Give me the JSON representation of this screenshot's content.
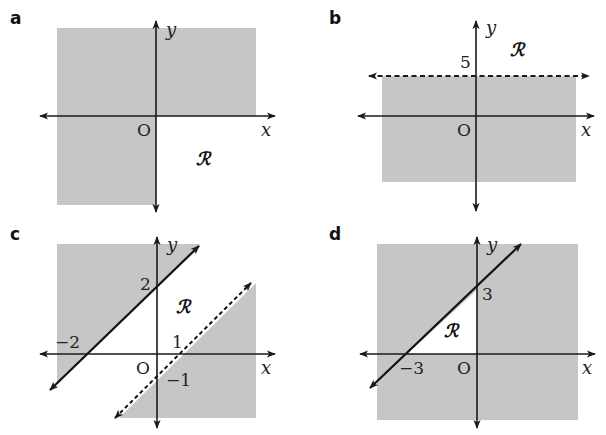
{
  "colors": {
    "shade": "#c6c6c6",
    "axis": "#1a1a1a",
    "background": "#ffffff"
  },
  "panels": [
    {
      "label": "a",
      "x_axis_label": "x",
      "y_axis_label": "y",
      "origin_label": "O",
      "region_label": "ℛ",
      "description": "Shaded everywhere except quadrant x>0, y<0 (region R unshaded)"
    },
    {
      "label": "b",
      "x_axis_label": "x",
      "y_axis_label": "y",
      "origin_label": "O",
      "region_label": "ℛ",
      "tick_labels": [
        "5"
      ],
      "boundary": {
        "equation": "y = 5",
        "style": "dashed"
      }
    },
    {
      "label": "c",
      "x_axis_label": "x",
      "y_axis_label": "y",
      "origin_label": "O",
      "region_label": "ℛ",
      "tick_labels": [
        "2",
        "−2",
        "1",
        "−1"
      ],
      "boundaries": [
        {
          "equation": "y = x + 2",
          "style": "solid"
        },
        {
          "equation": "y = x − 1",
          "style": "dashed"
        }
      ]
    },
    {
      "label": "d",
      "x_axis_label": "x",
      "y_axis_label": "y",
      "origin_label": "O",
      "region_label": "ℛ",
      "tick_labels": [
        "3",
        "−3"
      ],
      "boundary": {
        "equation": "y = x + 3",
        "style": "solid"
      }
    }
  ]
}
